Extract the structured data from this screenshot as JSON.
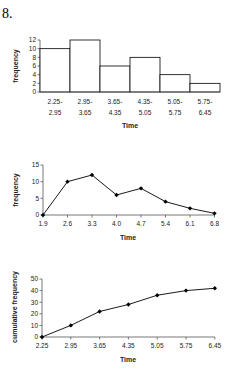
{
  "question_number": "8.",
  "chart_data": [
    {
      "type": "bar",
      "subtype": "histogram",
      "title": "",
      "xlabel": "Time",
      "ylabel": "frequency",
      "categories": [
        "2.25-2.95",
        "2.95-3.65",
        "3.65-4.35",
        "4.35-5.05",
        "5.05-5.75",
        "5.75-6.45"
      ],
      "category_lines": [
        [
          "2.25-",
          "2.95"
        ],
        [
          "2.95-",
          "3.65"
        ],
        [
          "3.65-",
          "4.35"
        ],
        [
          "4.35-",
          "5.05"
        ],
        [
          "5.05-",
          "5.75"
        ],
        [
          "5.75-",
          "6.45"
        ]
      ],
      "values": [
        10,
        12,
        6,
        8,
        4,
        2
      ],
      "ylim": [
        0,
        12
      ],
      "yticks": [
        0,
        2,
        4,
        6,
        8,
        10,
        12
      ],
      "grid": false,
      "legend": "none",
      "bar_fill": "#ffffff",
      "bar_stroke": "#000000"
    },
    {
      "type": "line",
      "subtype": "frequency polygon",
      "title": "",
      "xlabel": "Time",
      "ylabel": "frequency",
      "x": [
        "1.9",
        "2.6",
        "3.3",
        "4.0",
        "4.7",
        "5.4",
        "6.1",
        "6.8"
      ],
      "values": [
        0,
        10,
        12,
        6,
        8,
        4,
        2,
        0.5
      ],
      "ylim": [
        0,
        15
      ],
      "yticks": [
        0,
        5,
        10,
        15
      ],
      "marker": "diamond",
      "grid": false,
      "legend": "none"
    },
    {
      "type": "line",
      "subtype": "ogive",
      "title": "",
      "xlabel": "Time",
      "ylabel": "cumulative frequency",
      "x": [
        "2.25",
        "2.95",
        "3.65",
        "4.35",
        "5.05",
        "5.75",
        "6.45"
      ],
      "values": [
        0,
        10,
        22,
        28,
        36,
        40,
        42
      ],
      "ylim": [
        0,
        50
      ],
      "yticks": [
        0,
        10,
        20,
        30,
        40,
        50
      ],
      "marker": "diamond",
      "grid": false,
      "legend": "none"
    }
  ]
}
